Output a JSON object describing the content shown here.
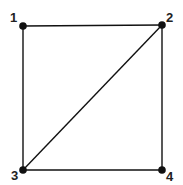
{
  "graph": {
    "nodes": [
      {
        "id": "1",
        "label": "1"
      },
      {
        "id": "2",
        "label": "2"
      },
      {
        "id": "3",
        "label": "3"
      },
      {
        "id": "4",
        "label": "4"
      }
    ],
    "edges": [
      {
        "from": "1",
        "to": "2"
      },
      {
        "from": "1",
        "to": "3"
      },
      {
        "from": "2",
        "to": "4"
      },
      {
        "from": "3",
        "to": "4"
      },
      {
        "from": "3",
        "to": "2"
      }
    ],
    "colors": {
      "stroke": "#111111",
      "node": "#111111",
      "label": "#222222"
    }
  }
}
